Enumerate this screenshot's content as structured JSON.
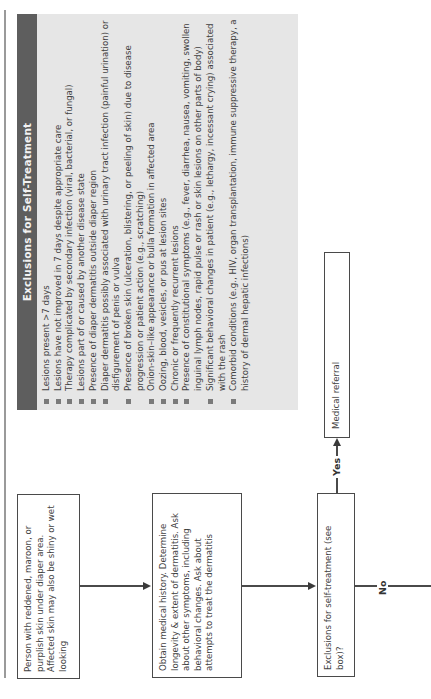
{
  "exclusions": {
    "title": "Exclusions for Self-Treatment",
    "items": [
      "Lesions present >7 days",
      "Lesions have not improved in 7 days despite appropriate care",
      "Therapy complicated by secondary infection (viral, bacterial, or fungal)",
      "Lesions part of or caused by another disease state",
      "Presence of diaper dermatitis outside diaper region",
      "Diaper dermatitis possibly associated with urinary tract infection (painful urination) or disfigurement of penis or vulva",
      "Presence of broken skin (ulceration, blistering, or peeling of skin) due to disease progression or patient action (e.g., scratching)",
      "Onion-skin–like appearance or bulla formation in affected area",
      "Oozing, blood, vesicles, or pus at lesion sites",
      "Chronic or frequently recurrent lesions",
      "Presence of constitutional symptoms (e.g., fever, diarrhea, nausea, vomiting, swollen inguinal lymph nodes, rapid pulse or rash or skin lesions on other parts of body)",
      "Significant behavioral changes in patient (e.g., lethargy, incessant crying) associated with the rash",
      "Comorbid conditions (e.g., HIV, organ transplantation, immune suppressive therapy, a history of dermal hepatic infections)"
    ],
    "colors": {
      "box_bg": "#e6e6e6",
      "header_bg": "#5e5e5e",
      "bullet": "#7a7a7a"
    }
  },
  "flowchart": {
    "nodes": {
      "presentation": "Person with reddened, maroon, or purplish skin under diaper area. Affected skin may also be shiny or wet looking",
      "history": "Obtain medical history. Determine longevity & extent of dermatitis. Ask about other symptoms, including behavioral changes. Ask about attempts to treat the dermatitis",
      "decision": "Exclusions for self-treatment (see box)?",
      "referral": "Medical referral"
    },
    "edges": {
      "yes_label": "Yes",
      "no_label": "No"
    }
  }
}
